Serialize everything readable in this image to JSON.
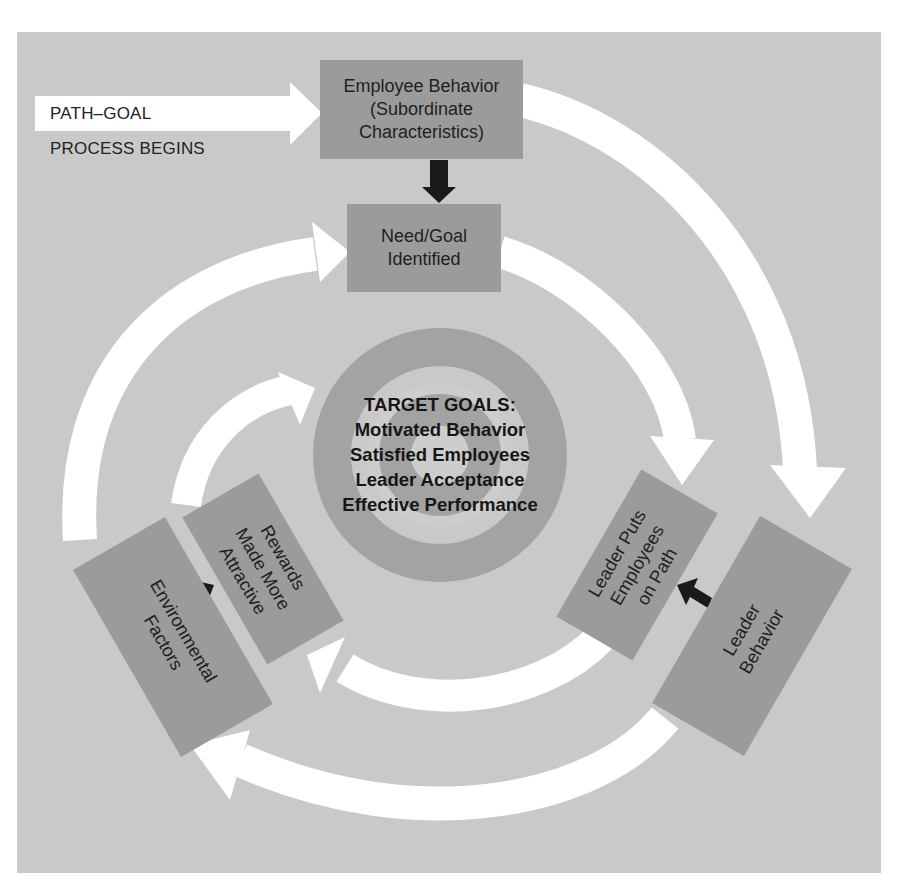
{
  "diagram": {
    "type": "path-goal process cycle",
    "colors": {
      "background": "#c9c9c9",
      "box_fill": "#9b9b9b",
      "target_dark_ring": "#a3a3a3",
      "target_light_ring": "#cdcdcd",
      "flow_arrow": "#ffffff",
      "causal_arrow": "#1a1a1a"
    },
    "start": {
      "line1": "PATH–GOAL",
      "line2": "PROCESS BEGINS"
    },
    "nodes": {
      "employee_behavior": {
        "line1": "Employee Behavior",
        "line2": "(Subordinate",
        "line3": "Characteristics)"
      },
      "need_goal": {
        "line1": "Need/Goal",
        "line2": "Identified"
      },
      "leader_puts": {
        "line1": "Leader Puts",
        "line2": "Employees",
        "line3": "on Path"
      },
      "leader_behavior": {
        "line1": "Leader",
        "line2": "Behavior"
      },
      "rewards": {
        "line1": "Rewards",
        "line2": "Made More",
        "line3": "Attractive"
      },
      "environmental": {
        "line1": "Environmental",
        "line2": "Factors"
      }
    },
    "target": {
      "title": "TARGET GOALS:",
      "goals": [
        "Motivated Behavior",
        "Satisfied Employees",
        "Leader Acceptance",
        "Effective Performance"
      ]
    },
    "edges": [
      {
        "from": "start",
        "to": "employee_behavior",
        "style": "white-arrow"
      },
      {
        "from": "employee_behavior",
        "to": "need_goal",
        "style": "black-arrow"
      },
      {
        "from": "employee_behavior",
        "to": "leader_behavior",
        "style": "white-arc"
      },
      {
        "from": "need_goal",
        "to": "leader_puts",
        "style": "white-arc"
      },
      {
        "from": "leader_behavior",
        "to": "leader_puts",
        "style": "black-arrow"
      },
      {
        "from": "leader_behavior",
        "to": "environmental",
        "style": "white-arc"
      },
      {
        "from": "leader_puts",
        "to": "rewards",
        "style": "white-arc"
      },
      {
        "from": "environmental",
        "to": "rewards",
        "style": "black-arrow"
      },
      {
        "from": "environmental",
        "to": "need_goal",
        "style": "white-arc"
      },
      {
        "from": "rewards",
        "to": "target",
        "style": "white-arc"
      }
    ]
  }
}
